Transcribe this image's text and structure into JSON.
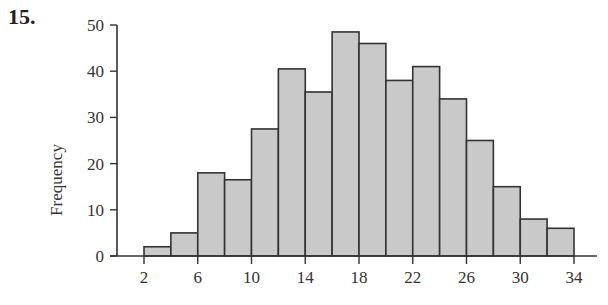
{
  "problem": {
    "number": "15."
  },
  "chart_data": {
    "type": "bar",
    "subtype": "histogram",
    "title": "",
    "xlabel": "",
    "ylabel": "Frequency",
    "bin_edges": [
      2,
      4,
      6,
      8,
      10,
      12,
      14,
      16,
      18,
      20,
      22,
      24,
      26,
      28,
      30,
      32,
      34
    ],
    "categories": [
      "2-4",
      "4-6",
      "6-8",
      "8-10",
      "10-12",
      "12-14",
      "14-16",
      "16-18",
      "18-20",
      "20-22",
      "22-24",
      "24-26",
      "26-28",
      "28-30",
      "30-32",
      "32-34"
    ],
    "values": [
      2,
      5,
      18,
      16.5,
      27.5,
      40.5,
      35.5,
      48.5,
      46,
      38,
      41,
      34,
      25,
      15,
      8,
      6
    ],
    "xlim": [
      0,
      36
    ],
    "ylim": [
      0,
      50
    ],
    "xticks": [
      2,
      6,
      10,
      14,
      18,
      22,
      26,
      30,
      34
    ],
    "yticks": [
      0,
      10,
      20,
      30,
      40,
      50
    ],
    "grid": false,
    "legend": null,
    "colors": {
      "bar_fill": "#c9c9c9",
      "bar_stroke": "#333333",
      "axis": "#333333"
    }
  }
}
